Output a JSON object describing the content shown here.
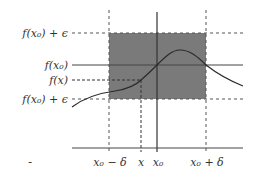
{
  "diagram": {
    "y_labels": {
      "upper": "f(x₀) + ϵ",
      "fx0": "f(x₀)",
      "fx": "f(x)",
      "lower": "f(x₀) + ϵ"
    },
    "x_labels": {
      "left": "x₀ − δ",
      "x": "x",
      "x0": "x₀",
      "right": "x₀ + δ"
    },
    "stray_mark": "-",
    "colors": {
      "shade": "#777777",
      "line": "#333333",
      "dash": "#555555"
    }
  }
}
